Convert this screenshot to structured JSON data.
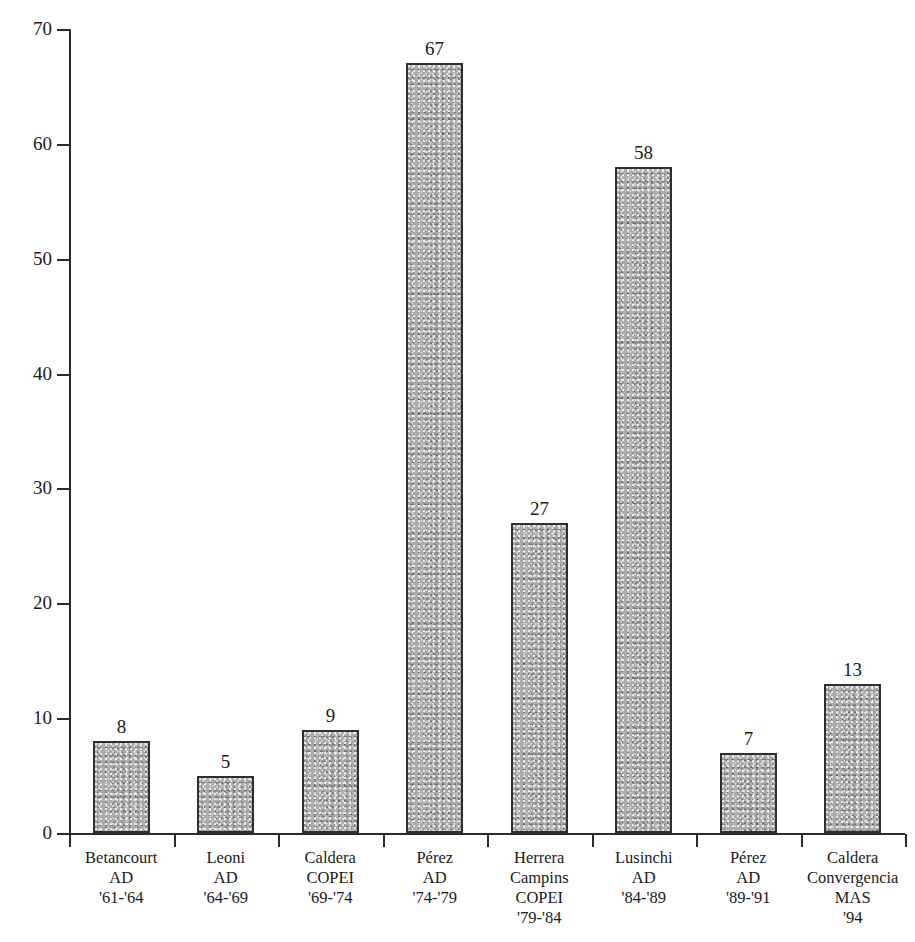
{
  "chart_data": {
    "type": "bar",
    "title": "",
    "xlabel": "",
    "ylabel": "Number of decrees issued",
    "ylim": [
      0,
      70
    ],
    "ytick_labels": [
      "0",
      "10",
      "20",
      "30",
      "40",
      "50",
      "60",
      "70"
    ],
    "ytick_values": [
      0,
      10,
      20,
      30,
      40,
      50,
      60,
      70
    ],
    "grid": false,
    "legend": "none",
    "categories": [
      "Betancourt AD '61-'64",
      "Leoni AD '64-'69",
      "Caldera COPEI '69-'74",
      "Pérez AD '74-'79",
      "Herrera Campins COPEI '79-'84",
      "Lusinchi AD '84-'89",
      "Pérez AD '89-'91",
      "Caldera Convergencia MAS '94"
    ],
    "category_lines": [
      [
        "Betancourt",
        "AD",
        "'61-'64"
      ],
      [
        "Leoni",
        "AD",
        "'64-'69"
      ],
      [
        "Caldera",
        "COPEI",
        "'69-'74"
      ],
      [
        "Pérez",
        "AD",
        "'74-'79"
      ],
      [
        "Herrera",
        "Campins",
        "COPEI",
        "'79-'84"
      ],
      [
        "Lusinchi",
        "AD",
        "'84-'89"
      ],
      [
        "Pérez",
        "AD",
        "'89-'91"
      ],
      [
        "Caldera",
        "Convergencia",
        "MAS",
        "'94"
      ]
    ],
    "values": [
      8,
      5,
      9,
      67,
      27,
      58,
      7,
      13
    ],
    "value_labels": [
      "8",
      "5",
      "9",
      "67",
      "27",
      "58",
      "7",
      "13"
    ],
    "colors": {
      "bar_fill": "#acacac",
      "bar_border": "#2f2f2f",
      "axis": "#2b2b2b",
      "text": "#1a1a1a",
      "background": "#ffffff"
    }
  }
}
